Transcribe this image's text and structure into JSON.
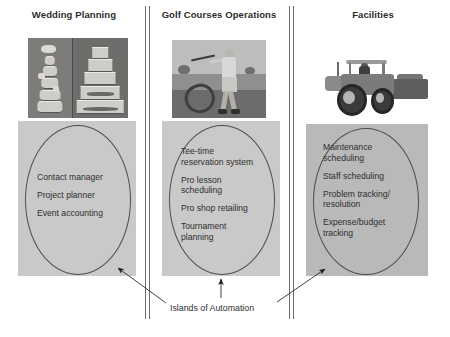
{
  "diagram": {
    "caption": "Islands of Automation",
    "accent_line_color": "#4e4e4e",
    "panel_fill_light": "#c9c9c9",
    "panel_fill_dark": "#b9b9b9",
    "columns": [
      {
        "id": "wedding-planning",
        "title": "Wedding Planning",
        "image_alt": "wedding-cakes-photo",
        "items": [
          "Contact manager",
          "Project planner",
          "Event accounting"
        ]
      },
      {
        "id": "golf-courses-operations",
        "title": "Golf Courses Operations",
        "image_alt": "golfer-swinging-photo",
        "items": [
          "Tee-time\nreservation system",
          "Pro lesson\nscheduling",
          "Pro shop retailing",
          "Tournament\nplanning"
        ]
      },
      {
        "id": "facilities",
        "title": "Facilities",
        "image_alt": "tractor-mower-photo",
        "items": [
          "Maintenance\nscheduling",
          "Staff scheduling",
          "Problem tracking/\nresolution",
          "Expense/budget\ntracking"
        ]
      }
    ]
  }
}
